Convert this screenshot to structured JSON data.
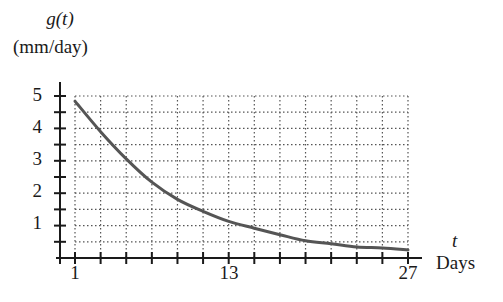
{
  "chart_data": {
    "type": "line",
    "title": "",
    "ylabel_var": "g(t)",
    "ylabel_unit": "(mm/day)",
    "xlabel_var": "t",
    "xlabel_unit": "Days",
    "xlim": [
      1,
      27
    ],
    "ylim": [
      0,
      5
    ],
    "x_ticks_labeled": [
      1,
      13,
      27
    ],
    "x_tick_step": 2,
    "y_ticks_labeled": [
      1,
      2,
      3,
      4,
      5
    ],
    "y_tick_step": 0.5,
    "grid": true,
    "grid_style": "dotted",
    "legend": null,
    "series": [
      {
        "name": "g(t)",
        "color": "#555555",
        "x": [
          1,
          3,
          5,
          7,
          9,
          11,
          13,
          15,
          17,
          19,
          21,
          23,
          25,
          27
        ],
        "y": [
          4.84,
          3.9,
          3.06,
          2.34,
          1.81,
          1.44,
          1.13,
          0.92,
          0.72,
          0.53,
          0.44,
          0.34,
          0.31,
          0.25
        ]
      }
    ]
  },
  "labels": {
    "y_var": "g(t)",
    "y_unit": "(mm/day)",
    "x_var": "t",
    "x_unit": "Days",
    "y_ticks": [
      "5",
      "4",
      "3",
      "2",
      "1"
    ],
    "x_ticks": [
      "1",
      "13",
      "27"
    ]
  },
  "colors": {
    "axis": "#1a1a1a",
    "grid": "#555555",
    "curve": "#555555"
  }
}
